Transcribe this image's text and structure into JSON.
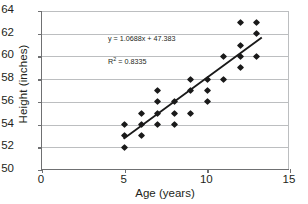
{
  "chart_data": {
    "type": "scatter",
    "title": "",
    "xlabel": "Age (years)",
    "ylabel": "Height (inches)",
    "xlim": [
      0,
      15
    ],
    "ylim": [
      50,
      64
    ],
    "xticks": [
      "0",
      "5",
      "10",
      "15"
    ],
    "xtick_values": [
      0,
      5,
      10,
      15
    ],
    "yticks": [
      "50",
      "52",
      "54",
      "56",
      "58",
      "60",
      "62",
      "64"
    ],
    "ytick_values": [
      50,
      52,
      54,
      56,
      58,
      60,
      62,
      64
    ],
    "grid": "horizontal",
    "legend": "none",
    "x": [
      5,
      5,
      5,
      6,
      6,
      6,
      7,
      7,
      7,
      7,
      8,
      8,
      8,
      9,
      9,
      9,
      10,
      10,
      10,
      11,
      11,
      12,
      12,
      12,
      12,
      13,
      13,
      13
    ],
    "y": [
      54,
      53,
      52,
      55,
      54,
      53,
      57,
      56,
      55,
      54,
      56,
      55,
      54,
      58,
      57,
      55,
      58,
      57,
      56,
      60,
      58,
      63,
      61,
      60,
      59,
      63,
      62,
      60
    ],
    "points": [
      {
        "x": 5,
        "y": 54
      },
      {
        "x": 5,
        "y": 53
      },
      {
        "x": 5,
        "y": 52
      },
      {
        "x": 6,
        "y": 55
      },
      {
        "x": 6,
        "y": 54
      },
      {
        "x": 6,
        "y": 53
      },
      {
        "x": 7,
        "y": 57
      },
      {
        "x": 7,
        "y": 56
      },
      {
        "x": 7,
        "y": 55
      },
      {
        "x": 7,
        "y": 54
      },
      {
        "x": 8,
        "y": 56
      },
      {
        "x": 8,
        "y": 55
      },
      {
        "x": 8,
        "y": 54
      },
      {
        "x": 9,
        "y": 58
      },
      {
        "x": 9,
        "y": 57
      },
      {
        "x": 9,
        "y": 55
      },
      {
        "x": 10,
        "y": 58
      },
      {
        "x": 10,
        "y": 57
      },
      {
        "x": 10,
        "y": 56
      },
      {
        "x": 11,
        "y": 60
      },
      {
        "x": 11,
        "y": 58
      },
      {
        "x": 12,
        "y": 63
      },
      {
        "x": 12,
        "y": 61
      },
      {
        "x": 12,
        "y": 60
      },
      {
        "x": 12,
        "y": 59
      },
      {
        "x": 13,
        "y": 63
      },
      {
        "x": 13,
        "y": 62
      },
      {
        "x": 13,
        "y": 60
      }
    ],
    "trendline": {
      "type": "linear",
      "slope": 1.0688,
      "intercept": 47.383,
      "r_squared": 0.8335,
      "x_start": 5,
      "x_end": 13.3
    },
    "annotations": {
      "equation": "y = 1.0688x + 47.383",
      "r_squared_prefix": "R",
      "r_squared_exponent": "2",
      "r_squared_value": " = 0.8335"
    },
    "colors": {
      "marker": "#1a1a1a",
      "trendline": "#1a1a1a",
      "gridline": "#bcbec0",
      "axis": "#6f7072",
      "text": "#231f20",
      "background": "#ffffff"
    }
  }
}
